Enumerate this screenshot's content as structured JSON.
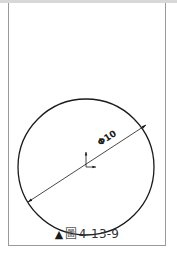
{
  "figure": {
    "caption_marker": "▲",
    "caption_prefix": "圖",
    "caption_number": "4-13-9",
    "dimension_label": "Φ10",
    "dimension_value": "10",
    "dimension_symbol": "diameter"
  },
  "colors": {
    "frame": "#9a9a9a",
    "line": "#1a1a1a",
    "caption_text": "#333333",
    "background": "#ffffff"
  }
}
